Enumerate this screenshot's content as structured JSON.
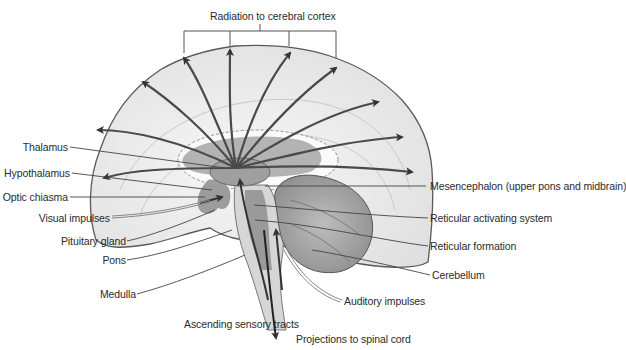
{
  "diagram": {
    "type": "anatomical-illustration",
    "colors": {
      "cortex_fill": "#ececec",
      "cortex_outline": "#5a5a5a",
      "thalamus_fill": "#a9a9a9",
      "cerebellum_fill": "#9d9d9d",
      "arrow": "#3a3a3a",
      "leader_line": "#444444"
    },
    "labels": {
      "top": "Radiation to cerebral cortex",
      "left": [
        "Thalamus",
        "Hypothalamus",
        "Optic chiasma",
        "Visual impulses",
        "Pituitary gland",
        "Pons",
        "Medulla"
      ],
      "right": [
        "Mesencephalon (upper pons and midbrain)",
        "Reticular activating system",
        "Reticular formation",
        "Cerebellum"
      ],
      "bottom": [
        "Auditory impulses",
        "Ascending sensory tracts",
        "Projections to spinal cord"
      ]
    }
  }
}
